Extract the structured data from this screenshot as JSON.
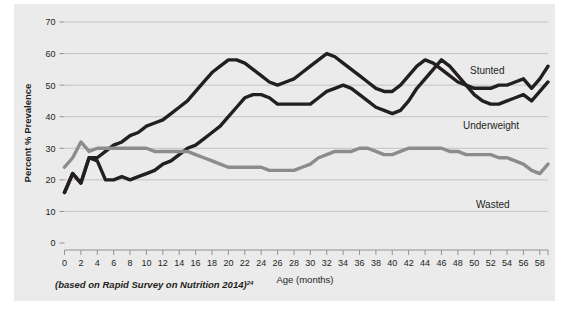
{
  "figure": {
    "background_color": "#ffffff",
    "panel_color": "#ebebeb",
    "footnote_text": "(based on Rapid Survey on Nutrition 2014)",
    "footnote_superscript": "24"
  },
  "chart_data": {
    "type": "line",
    "title": "",
    "subtitle": "",
    "xlabel": "Age (months)",
    "ylabel": "Percent % Prevalence",
    "xlim": [
      0,
      59
    ],
    "ylim": [
      0,
      70
    ],
    "xticks": [
      0,
      2,
      4,
      6,
      8,
      10,
      12,
      14,
      16,
      18,
      20,
      22,
      24,
      26,
      28,
      30,
      32,
      34,
      36,
      38,
      40,
      42,
      44,
      46,
      48,
      50,
      52,
      54,
      56,
      58
    ],
    "xticklabels": [
      "0",
      "2",
      "4",
      "6",
      "8",
      "10",
      "12",
      "14",
      "16",
      "18",
      "20",
      "22",
      "24",
      "26",
      "28",
      "30",
      "32",
      "34",
      "36",
      "38",
      "40",
      "42",
      "44",
      "46",
      "48",
      "50",
      "52",
      "54",
      "56",
      "58"
    ],
    "yticks": [
      0,
      10,
      20,
      30,
      40,
      50,
      60,
      70
    ],
    "yticklabels": [
      "0",
      "10",
      "20",
      "30",
      "40",
      "50",
      "60",
      "70"
    ],
    "grid": true,
    "grid_axis": "y",
    "legend": "inline-labels",
    "legend_position": "right-of-lines",
    "x": [
      0,
      1,
      2,
      3,
      4,
      5,
      6,
      7,
      8,
      9,
      10,
      11,
      12,
      13,
      14,
      15,
      16,
      17,
      18,
      19,
      20,
      21,
      22,
      23,
      24,
      25,
      26,
      27,
      28,
      29,
      30,
      31,
      32,
      33,
      34,
      35,
      36,
      37,
      38,
      39,
      40,
      41,
      42,
      43,
      44,
      45,
      46,
      47,
      48,
      49,
      50,
      51,
      52,
      53,
      54,
      55,
      56,
      57,
      58,
      59
    ],
    "series": [
      {
        "name": "Stunted",
        "color": "#231f20",
        "line_width": 3.4,
        "label": "Stunted",
        "values": [
          16,
          22,
          19,
          27,
          27,
          29,
          31,
          32,
          34,
          35,
          37,
          38,
          39,
          41,
          43,
          45,
          48,
          51,
          54,
          56,
          58,
          58,
          57,
          55,
          53,
          51,
          50,
          51,
          52,
          54,
          56,
          58,
          60,
          59,
          57,
          55,
          53,
          51,
          49,
          48,
          48,
          50,
          53,
          56,
          58,
          57,
          55,
          53,
          51,
          50,
          49,
          49,
          49,
          50,
          50,
          51,
          52,
          49,
          52,
          56
        ]
      },
      {
        "name": "Underweight",
        "color": "#231f20",
        "line_width": 3.4,
        "label": "Underweight",
        "values": [
          16,
          22,
          19,
          27,
          26,
          20,
          20,
          21,
          20,
          21,
          22,
          23,
          25,
          26,
          28,
          30,
          31,
          33,
          35,
          37,
          40,
          43,
          46,
          47,
          47,
          46,
          44,
          44,
          44,
          44,
          44,
          46,
          48,
          49,
          50,
          49,
          47,
          45,
          43,
          42,
          41,
          42,
          45,
          49,
          52,
          55,
          58,
          56,
          53,
          50,
          47,
          45,
          44,
          44,
          45,
          46,
          47,
          45,
          48,
          51
        ]
      },
      {
        "name": "Wasted",
        "color": "#8c8c8c",
        "line_width": 3.4,
        "label": "Wasted",
        "values": [
          24,
          27,
          32,
          29,
          30,
          30,
          30,
          30,
          30,
          30,
          30,
          29,
          29,
          29,
          29,
          29,
          28,
          27,
          26,
          25,
          24,
          24,
          24,
          24,
          24,
          23,
          23,
          23,
          23,
          24,
          25,
          27,
          28,
          29,
          29,
          29,
          30,
          30,
          29,
          28,
          28,
          29,
          30,
          30,
          30,
          30,
          30,
          29,
          29,
          28,
          28,
          28,
          28,
          27,
          27,
          26,
          25,
          23,
          22,
          25
        ]
      }
    ]
  },
  "axes": {
    "y_axis_title": "Percent % Prevalence",
    "x_axis_title": "Age (months)"
  },
  "series_labels": {
    "stunted": "Stunted",
    "underweight": "Underweight",
    "wasted": "Wasted"
  }
}
